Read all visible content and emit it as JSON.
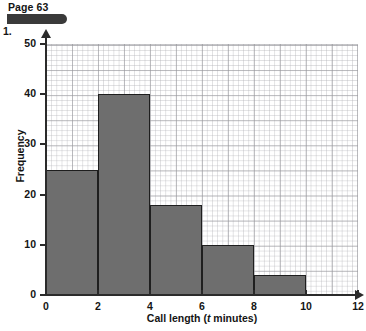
{
  "header": {
    "page_label": "Page 63",
    "question_number": "1."
  },
  "chart_data": {
    "type": "bar",
    "title": "",
    "subtitle": "",
    "xlabel_prefix": "Call length (",
    "xlabel_italic": "t",
    "xlabel_suffix": " minutes)",
    "xlabel": "Call length (t minutes)",
    "ylabel": "Frequency",
    "xlim": [
      0,
      12
    ],
    "ylim": [
      0,
      50
    ],
    "xticks": [
      0,
      2,
      4,
      6,
      8,
      10,
      12
    ],
    "xtick_labels": [
      "0",
      "2",
      "4",
      "6",
      "8",
      "10",
      "12"
    ],
    "yticks": [
      0,
      10,
      20,
      30,
      40,
      50
    ],
    "ytick_labels": [
      "0",
      "10",
      "20",
      "30",
      "40",
      "50"
    ],
    "grid": true,
    "grid_minor_step": 0.2,
    "grid_major_step": 1,
    "legend": false,
    "bar_fill_color": "#6e6e6e",
    "bar_edge_color": "#1e1e1e",
    "axis_color": "#2b2b2b",
    "bins": [
      {
        "label": "0-2",
        "x_start": 0,
        "x_end": 2,
        "frequency": 25
      },
      {
        "label": "2-4",
        "x_start": 2,
        "x_end": 4,
        "frequency": 40
      },
      {
        "label": "4-6",
        "x_start": 4,
        "x_end": 6,
        "frequency": 18
      },
      {
        "label": "6-8",
        "x_start": 6,
        "x_end": 8,
        "frequency": 10
      },
      {
        "label": "8-10",
        "x_start": 8,
        "x_end": 10,
        "frequency": 4
      }
    ],
    "categories": [
      "0-2",
      "2-4",
      "4-6",
      "6-8",
      "8-10"
    ],
    "values": [
      25,
      40,
      18,
      10,
      4
    ]
  }
}
